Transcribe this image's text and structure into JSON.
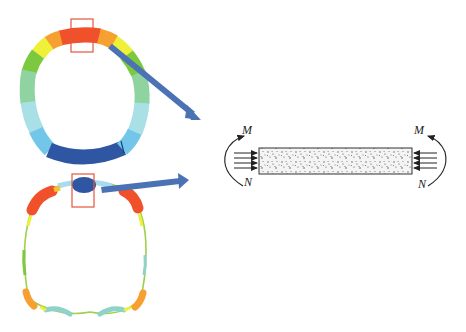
{
  "diagram": {
    "top_ring": {
      "name": "bending-moment-contour",
      "segments": [
        {
          "position": "crown",
          "color": "#f0502a"
        },
        {
          "position": "crown-left-shoulder",
          "color": "#f5a030"
        },
        {
          "position": "left-shoulder-yellow",
          "color": "#eef03a"
        },
        {
          "position": "left-upper-wall",
          "color": "#7cc83e"
        },
        {
          "position": "left-wall",
          "color": "#8fd3a0"
        },
        {
          "position": "left-lower-wall",
          "color": "#a8e0e6"
        },
        {
          "position": "left-haunch",
          "color": "#72c6ea"
        },
        {
          "position": "invert",
          "color": "#2e56a2"
        },
        {
          "position": "right-haunch",
          "color": "#72c6ea"
        },
        {
          "position": "right-lower-wall",
          "color": "#a8e0e6"
        },
        {
          "position": "right-wall",
          "color": "#8fd3a0"
        },
        {
          "position": "right-upper-wall",
          "color": "#7cc83e"
        },
        {
          "position": "right-shoulder-yellow",
          "color": "#eef03a"
        }
      ]
    },
    "bottom_ring": {
      "name": "deformed-internal-force-contour",
      "highlights": [
        {
          "position": "crown",
          "color": "#2e56a2"
        },
        {
          "position": "left-shoulder",
          "color": "#f0502a"
        },
        {
          "position": "right-shoulder",
          "color": "#f0502a"
        },
        {
          "position": "left-foot",
          "color": "#f5a030"
        },
        {
          "position": "right-foot",
          "color": "#f5a030"
        },
        {
          "position": "invert-lobes",
          "color": "#8fd3c8"
        }
      ]
    },
    "highlight_box_color": "#e8553a",
    "arrow_color": "#4a72b4",
    "beam": {
      "fill_pattern": "concrete-speckle",
      "left_labels": {
        "moment": "M",
        "axial": "N"
      },
      "right_labels": {
        "moment": "M",
        "axial": "N"
      }
    }
  }
}
